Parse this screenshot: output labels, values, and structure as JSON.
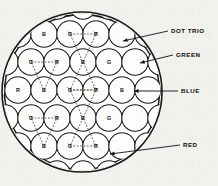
{
  "figure": {
    "screen": {
      "shape": "circle",
      "center_x": 82,
      "center_y": 92,
      "radius": 80,
      "stroke_color": "#1a1a1a",
      "fill_color": "#ffffff"
    },
    "dot_radius": 13.2,
    "dot_fill": "#fdfdfc",
    "dot_stroke": "#1a1a1a",
    "trio_line_color": "#3a3a3a",
    "rows": [
      {
        "row_index": 0,
        "y": 34,
        "dots": [
          {
            "label": "B",
            "x": 44
          },
          {
            "label": "G",
            "x": 70
          },
          {
            "label": "R",
            "x": 96
          }
        ]
      },
      {
        "row_index": 1,
        "y": 62,
        "dots": [
          {
            "label": "G",
            "x": 31
          },
          {
            "label": "R",
            "x": 57
          },
          {
            "label": "B",
            "x": 83
          },
          {
            "label": "G",
            "x": 109
          }
        ]
      },
      {
        "row_index": 2,
        "y": 90,
        "dots": [
          {
            "label": "R",
            "x": 18
          },
          {
            "label": "B",
            "x": 44
          },
          {
            "label": "G",
            "x": 70
          },
          {
            "label": "R",
            "x": 96
          },
          {
            "label": "B",
            "x": 122
          }
        ]
      },
      {
        "row_index": 3,
        "y": 118,
        "dots": [
          {
            "label": "G",
            "x": 31
          },
          {
            "label": "R",
            "x": 57
          },
          {
            "label": "B",
            "x": 83
          },
          {
            "label": "G",
            "x": 109
          }
        ]
      },
      {
        "row_index": 4,
        "y": 146,
        "dots": [
          {
            "label": "B",
            "x": 44
          },
          {
            "label": "G",
            "x": 70
          },
          {
            "label": "R",
            "x": 96
          }
        ]
      }
    ],
    "trios": [
      {
        "name": "trio-top-center",
        "points": [
          [
            70,
            34
          ],
          [
            96,
            34
          ],
          [
            83,
            62
          ]
        ]
      },
      {
        "name": "trio-row2-left",
        "points": [
          [
            31,
            62
          ],
          [
            57,
            62
          ],
          [
            44,
            90
          ]
        ]
      },
      {
        "name": "trio-row2-right",
        "points": [
          [
            83,
            62
          ],
          [
            70,
            90
          ],
          [
            96,
            90
          ]
        ]
      },
      {
        "name": "trio-row3-center",
        "points": [
          [
            70,
            90
          ],
          [
            96,
            90
          ],
          [
            83,
            118
          ]
        ]
      },
      {
        "name": "trio-row4-left",
        "points": [
          [
            31,
            118
          ],
          [
            57,
            118
          ],
          [
            44,
            146
          ]
        ]
      },
      {
        "name": "trio-row4-right",
        "points": [
          [
            83,
            118
          ],
          [
            70,
            146
          ],
          [
            96,
            146
          ]
        ]
      }
    ],
    "callouts": [
      {
        "id": "dot-trio",
        "label": "DOT TRIO",
        "text_x": 171,
        "text_y": 31,
        "leader": [
          [
            168,
            31
          ],
          [
            123,
            41
          ]
        ]
      },
      {
        "id": "green",
        "label": "GREEN",
        "text_x": 176,
        "text_y": 55,
        "leader": [
          [
            173,
            55
          ],
          [
            140,
            63
          ]
        ]
      },
      {
        "id": "blue",
        "label": "BLUE",
        "text_x": 181,
        "text_y": 91,
        "leader": [
          [
            178,
            91
          ],
          [
            134,
            91
          ]
        ]
      },
      {
        "id": "red",
        "label": "RED",
        "text_x": 183,
        "text_y": 145,
        "leader": [
          [
            180,
            145
          ],
          [
            110,
            154
          ]
        ]
      }
    ],
    "legend_note": "R = red phosphor dot, G = green phosphor dot, B = blue phosphor dot"
  }
}
